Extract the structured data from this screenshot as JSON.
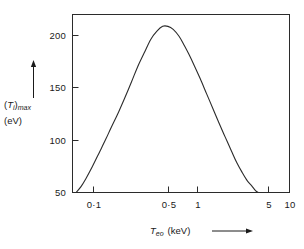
{
  "figure": {
    "background_color": "#ffffff",
    "line_color": "#2b2b2b",
    "axis_color": "#2b2b2b"
  },
  "axes": {
    "y_label_line1_prefix": "(",
    "y_label_symbol": "T",
    "y_label_symbol_sub": "i",
    "y_label_line1_suffix": ")",
    "y_label_line1_sub": "max",
    "y_label_line2": "(eV)",
    "y_label_full": "(Ti)max (eV)",
    "x_label_symbol": "T",
    "x_label_symbol_sub": "eo",
    "x_label_units": "(keV)",
    "x_label_full": "Teo (keV)",
    "y_arrow_icon": "up-arrow-icon",
    "x_arrow_icon": "right-arrow-icon"
  },
  "chart_data": {
    "type": "line",
    "title": "",
    "subtitle": "",
    "xlabel": "Teo (keV)",
    "ylabel": "(Ti)max (eV)",
    "xscale": "log",
    "yscale": "linear",
    "xlim": [
      0.07,
      10
    ],
    "ylim": [
      50,
      230
    ],
    "grid": false,
    "legend": null,
    "xticks": [
      0.1,
      0.5,
      1,
      5,
      10
    ],
    "xticklabels": [
      "0·1",
      "0·5",
      "1",
      "5",
      "10"
    ],
    "yticks": [
      50,
      100,
      150,
      200
    ],
    "yticklabels": [
      "50",
      "100",
      "150",
      "200"
    ],
    "series": [
      {
        "name": "(Ti)max vs Teo",
        "x": [
          0.076,
          0.085,
          0.095,
          0.11,
          0.13,
          0.15,
          0.17,
          0.2,
          0.23,
          0.27,
          0.31,
          0.36,
          0.42,
          0.48,
          0.55,
          0.62,
          0.7,
          0.8,
          0.9,
          1.0,
          1.15,
          1.3,
          1.5,
          1.75,
          2.0,
          2.3,
          2.65,
          3.0,
          3.4,
          3.8,
          4.2,
          4.6,
          4.9
        ],
        "y": [
          50,
          56,
          64,
          76,
          91,
          104,
          116,
          131,
          145,
          162,
          177,
          191,
          205,
          213,
          218,
          218,
          215,
          208,
          199,
          190,
          177,
          165,
          150,
          134,
          120,
          106,
          92,
          80,
          70,
          62,
          57,
          52,
          50
        ]
      }
    ],
    "peak": {
      "x": 0.58,
      "y": 219
    },
    "annotations": []
  },
  "ticks": {
    "y": [
      {
        "label": "200",
        "value": 200
      },
      {
        "label": "150",
        "value": 150
      },
      {
        "label": "100",
        "value": 100
      },
      {
        "label": "50",
        "value": 50
      }
    ],
    "x": [
      {
        "label": "0·1",
        "value": 0.1
      },
      {
        "label": "0·5",
        "value": 0.5
      },
      {
        "label": "1",
        "value": 1
      },
      {
        "label": "5",
        "value": 5
      },
      {
        "label": "10",
        "value": 10
      }
    ]
  }
}
